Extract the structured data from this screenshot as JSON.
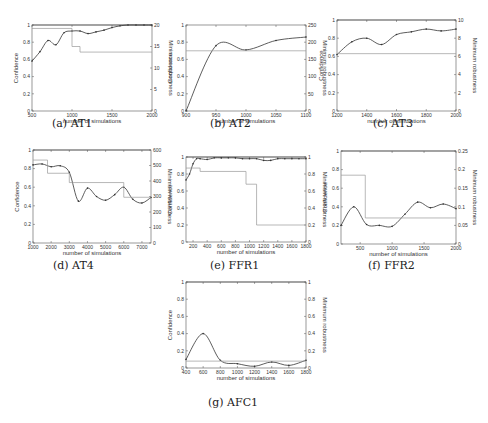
{
  "figure": {
    "common": {
      "xlabel": "number of simulations",
      "ylabel_left": "Confidence",
      "ylabel_right": "Minimum robustness"
    },
    "panels": [
      {
        "id": "a",
        "caption": "(a) AT1"
      },
      {
        "id": "b",
        "caption": "(b) AT2"
      },
      {
        "id": "c",
        "caption": "(c) AT3"
      },
      {
        "id": "d",
        "caption": "(d) AT4"
      },
      {
        "id": "e",
        "caption": "(e) FFR1"
      },
      {
        "id": "f",
        "caption": "(f) FFR2"
      },
      {
        "id": "g",
        "caption": "(g) AFC1"
      }
    ]
  },
  "chart_data": [
    {
      "type": "line",
      "title": "(a) AT1",
      "xlabel": "number of simulations",
      "ylabel": "Confidence",
      "ylabel_right": "Minimum robustness",
      "xlim": [
        500,
        2000
      ],
      "ylim": [
        0,
        1
      ],
      "ylim_right": [
        0,
        20
      ],
      "xticks": [
        500,
        1000,
        1500,
        2000
      ],
      "yticks": [
        0,
        0.2,
        0.4,
        0.6,
        0.8,
        1
      ],
      "yticks_right": [
        0,
        5,
        10,
        15,
        20
      ],
      "series": [
        {
          "name": "Confidence",
          "axis": "left",
          "x": [
            500,
            600,
            700,
            800,
            900,
            1000,
            1100,
            1200,
            1300,
            1400,
            1500,
            1600,
            1700,
            1800,
            1900,
            2000
          ],
          "values": [
            0.58,
            0.69,
            0.82,
            0.77,
            0.91,
            0.93,
            0.93,
            0.9,
            0.92,
            0.94,
            0.97,
            0.99,
            1.0,
            1.0,
            1.0,
            1.0
          ]
        },
        {
          "name": "Minimum robustness",
          "axis": "right",
          "step": true,
          "x": [
            500,
            1000,
            1000,
            1100,
            1100,
            2000
          ],
          "values": [
            19.2,
            19.2,
            15,
            15,
            13.7,
            13.7
          ]
        },
        {
          "name": "Upper bound",
          "axis": "left",
          "x": [
            500,
            2000
          ],
          "values": [
            1,
            1
          ]
        }
      ]
    },
    {
      "type": "line",
      "title": "(b) AT2",
      "xlabel": "number of simulations",
      "ylabel": "Confidence",
      "ylabel_right": "Minimum robustness",
      "xlim": [
        900,
        1100
      ],
      "ylim": [
        0,
        1
      ],
      "ylim_right": [
        0,
        250
      ],
      "xticks": [
        900,
        950,
        1000,
        1050,
        1100
      ],
      "yticks": [
        0,
        0.2,
        0.4,
        0.6,
        0.8,
        1
      ],
      "yticks_right": [
        0,
        50,
        100,
        150,
        200,
        250
      ],
      "series": [
        {
          "name": "Confidence",
          "axis": "left",
          "x": [
            900,
            950,
            1000,
            1050,
            1100
          ],
          "values": [
            0.0,
            0.76,
            0.71,
            0.82,
            0.86
          ]
        },
        {
          "name": "Minimum robustness",
          "axis": "right",
          "step": true,
          "x": [
            900,
            1100
          ],
          "values": [
            175,
            175
          ]
        }
      ]
    },
    {
      "type": "line",
      "title": "(c) AT3",
      "xlabel": "number of simulations",
      "ylabel": "Confidence",
      "ylabel_right": "Minimum robustness",
      "xlim": [
        1200,
        2000
      ],
      "ylim": [
        0,
        1
      ],
      "ylim_right": [
        0,
        10
      ],
      "xticks": [
        1200,
        1400,
        1600,
        1800,
        2000
      ],
      "yticks": [
        0,
        0.2,
        0.4,
        0.6,
        0.8,
        1
      ],
      "yticks_right": [
        0,
        2,
        4,
        6,
        8,
        10
      ],
      "series": [
        {
          "name": "Confidence",
          "axis": "left",
          "x": [
            1200,
            1300,
            1400,
            1500,
            1600,
            1700,
            1800,
            1900,
            2000
          ],
          "values": [
            0.62,
            0.76,
            0.8,
            0.73,
            0.84,
            0.87,
            0.9,
            0.88,
            0.9
          ]
        },
        {
          "name": "Minimum robustness",
          "axis": "right",
          "step": true,
          "x": [
            1200,
            2000
          ],
          "values": [
            6.3,
            6.3
          ]
        },
        {
          "name": "Upper bound",
          "axis": "left",
          "x": [
            1200,
            2000
          ],
          "values": [
            1,
            1
          ]
        }
      ]
    },
    {
      "type": "line",
      "title": "(d) AT4",
      "xlabel": "number of simulations",
      "ylabel": "Confidence",
      "ylabel_right": "Minimum robustness",
      "xlim": [
        1000,
        7500
      ],
      "ylim": [
        0,
        1
      ],
      "ylim_right": [
        0,
        600
      ],
      "xticks": [
        1000,
        2000,
        3000,
        4000,
        5000,
        6000,
        7000
      ],
      "yticks": [
        0,
        0.2,
        0.4,
        0.6,
        0.8,
        1
      ],
      "yticks_right": [
        0,
        100,
        200,
        300,
        400,
        500,
        600
      ],
      "series": [
        {
          "name": "Confidence",
          "axis": "left",
          "x": [
            1000,
            1500,
            2000,
            2500,
            3000,
            3500,
            4000,
            4500,
            5000,
            5500,
            6000,
            6500,
            7000,
            7500
          ],
          "values": [
            0.84,
            0.85,
            0.82,
            0.83,
            0.76,
            0.45,
            0.59,
            0.5,
            0.46,
            0.52,
            0.6,
            0.47,
            0.43,
            0.49
          ]
        },
        {
          "name": "Minimum robustness",
          "axis": "right",
          "step": true,
          "x": [
            1000,
            1800,
            1800,
            3000,
            3000,
            6000,
            6000,
            7500
          ],
          "values": [
            535,
            535,
            450,
            450,
            390,
            390,
            295,
            295
          ]
        },
        {
          "name": "Upper bound",
          "axis": "left",
          "x": [
            1000,
            7500
          ],
          "values": [
            1,
            1
          ]
        }
      ]
    },
    {
      "type": "line",
      "title": "(e) FFR1",
      "xlabel": "number of simulations",
      "ylabel": "Confidence",
      "ylabel_right": "Minimum robustness",
      "xlim": [
        100,
        1800
      ],
      "ylim": [
        0,
        1
      ],
      "ylim_right": [
        0,
        1
      ],
      "xticks": [
        200,
        400,
        600,
        800,
        1000,
        1200,
        1400,
        1600,
        1800
      ],
      "yticks": [
        0,
        0.2,
        0.4,
        0.6,
        0.8,
        1
      ],
      "yticks_right": [
        0,
        0.2,
        0.4,
        0.6,
        0.8,
        1
      ],
      "series": [
        {
          "name": "Confidence",
          "axis": "left",
          "x": [
            100,
            150,
            200,
            250,
            300,
            400,
            500,
            600,
            700,
            800,
            900,
            1000,
            1100,
            1200,
            1300,
            1400,
            1500,
            1600,
            1700,
            1800
          ],
          "values": [
            0.73,
            0.8,
            0.92,
            0.98,
            0.98,
            0.97,
            0.99,
            0.99,
            0.99,
            0.99,
            0.98,
            0.98,
            0.98,
            0.96,
            0.96,
            0.98,
            0.98,
            0.98,
            0.98,
            0.98
          ]
        },
        {
          "name": "Minimum robustness",
          "axis": "right",
          "step": true,
          "x": [
            100,
            300,
            300,
            950,
            950,
            1100,
            1100,
            1800
          ],
          "values": [
            0.87,
            0.87,
            0.83,
            0.83,
            0.68,
            0.68,
            0.2,
            0.2
          ]
        },
        {
          "name": "Upper bound",
          "axis": "left",
          "x": [
            100,
            1800
          ],
          "values": [
            1,
            1
          ]
        }
      ]
    },
    {
      "type": "line",
      "title": "(f) FFR2",
      "xlabel": "number of simulations",
      "ylabel": "Confidence",
      "ylabel_right": "Minimum robustness",
      "xlim": [
        200,
        2000
      ],
      "ylim": [
        0,
        1
      ],
      "ylim_right": [
        0,
        0.25
      ],
      "xticks": [
        500,
        1000,
        1500,
        2000
      ],
      "yticks": [
        0,
        0.2,
        0.4,
        0.6,
        0.8,
        1
      ],
      "yticks_right": [
        0,
        0.05,
        0.1,
        0.15,
        0.2,
        0.25
      ],
      "series": [
        {
          "name": "Confidence",
          "axis": "left",
          "x": [
            200,
            400,
            600,
            800,
            1000,
            1200,
            1400,
            1600,
            1800,
            2000
          ],
          "values": [
            0.2,
            0.4,
            0.21,
            0.2,
            0.19,
            0.32,
            0.45,
            0.39,
            0.43,
            0.38
          ]
        },
        {
          "name": "Minimum robustness",
          "axis": "right",
          "step": true,
          "x": [
            200,
            580,
            580,
            2000
          ],
          "values": [
            0.185,
            0.185,
            0.07,
            0.07
          ]
        },
        {
          "name": "Upper bound",
          "axis": "left",
          "x": [
            200,
            2000
          ],
          "values": [
            1,
            1
          ]
        }
      ]
    },
    {
      "type": "line",
      "title": "(g) AFC1",
      "xlabel": "number of simulations",
      "ylabel": "Confidence",
      "ylabel_right": "Minimum robustness",
      "xlim": [
        400,
        1800
      ],
      "ylim": [
        0,
        1
      ],
      "ylim_right": [
        0,
        1
      ],
      "xticks": [
        400,
        600,
        800,
        1000,
        1200,
        1400,
        1600,
        1800
      ],
      "yticks": [
        0,
        0.2,
        0.4,
        0.6,
        0.8,
        1
      ],
      "yticks_right": [
        0,
        0.2,
        0.4,
        0.6,
        0.8,
        1
      ],
      "series": [
        {
          "name": "Confidence",
          "axis": "left",
          "x": [
            400,
            600,
            800,
            1000,
            1200,
            1400,
            1600,
            1800
          ],
          "values": [
            0.1,
            0.4,
            0.09,
            0.05,
            0.02,
            0.07,
            0.03,
            0.09
          ]
        },
        {
          "name": "Minimum robustness",
          "axis": "right",
          "step": true,
          "x": [
            400,
            1800
          ],
          "values": [
            0.08,
            0.08
          ]
        },
        {
          "name": "Upper bound",
          "axis": "left",
          "x": [
            400,
            1800
          ],
          "values": [
            1,
            1
          ]
        }
      ]
    }
  ],
  "layout": {
    "panels": [
      {
        "left": 32,
        "top": 25,
        "width": 120,
        "height": 86,
        "cap_x": 78,
        "cap_y": 120
      },
      {
        "left": 186,
        "top": 25,
        "width": 120,
        "height": 86,
        "cap_x": 232,
        "cap_y": 120
      },
      {
        "left": 337,
        "top": 20,
        "width": 119,
        "height": 91,
        "cap_x": 392,
        "cap_y": 120
      },
      {
        "left": 33,
        "top": 150,
        "width": 118,
        "height": 93,
        "cap_x": 78,
        "cap_y": 262
      },
      {
        "left": 186,
        "top": 157,
        "width": 120,
        "height": 85,
        "cap_x": 238,
        "cap_y": 262
      },
      {
        "left": 341,
        "top": 151,
        "width": 115,
        "height": 93,
        "cap_x": 392,
        "cap_y": 262
      },
      {
        "left": 186,
        "top": 282,
        "width": 120,
        "height": 86,
        "cap_x": 235,
        "cap_y": 399
      }
    ]
  }
}
